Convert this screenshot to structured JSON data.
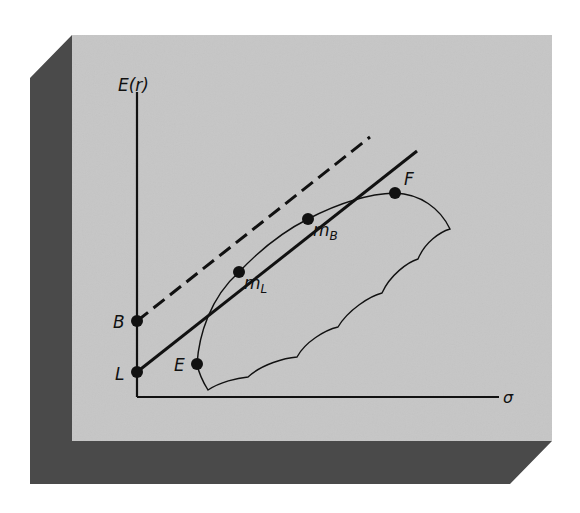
{
  "figure": {
    "y_axis_label": "E(r)",
    "x_axis_label": "σ",
    "points": {
      "B": "B",
      "L": "L",
      "E": "E",
      "F": "F",
      "mL_main": "m",
      "mL_sub": "L",
      "mB_main": "m",
      "mB_sub": "B"
    },
    "lines": [
      {
        "name": "borrowing-line",
        "style": "dashed",
        "from": "B",
        "through": "m_B"
      },
      {
        "name": "lending-line",
        "style": "solid",
        "from": "L",
        "through": "m_L"
      }
    ],
    "colors": {
      "panel": "#c4c4c4",
      "shadow": "#4a4a4a",
      "ink": "#111111"
    }
  }
}
